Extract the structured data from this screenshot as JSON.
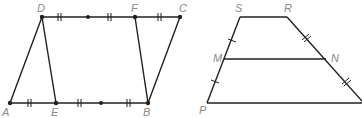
{
  "diagram": {
    "left_figure": {
      "labels": {
        "D": "D",
        "F": "F",
        "C": "C",
        "A": "A",
        "E": "E",
        "B": "B"
      },
      "segments": [
        "AD",
        "DE",
        "FB",
        "BC",
        "DC",
        "AB"
      ],
      "tick_marks": "double ticks on AE, E-mid, mid-B, D-mid, mid-F, FC",
      "midpoint_dots": 2
    },
    "right_figure": {
      "labels": {
        "S": "S",
        "R": "R",
        "M": "M",
        "N": "N",
        "P": "P"
      },
      "segments": [
        "SR",
        "SP",
        "RQ",
        "MN",
        "PQ"
      ],
      "tick_marks": "single ticks on SM and MP; double ticks on RN and N-bottom"
    },
    "colors": {
      "line": "#231f20",
      "label": "#8a8a8a"
    }
  }
}
